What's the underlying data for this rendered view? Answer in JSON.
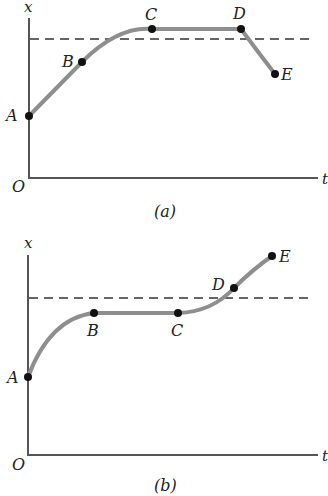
{
  "figures": [
    {
      "caption": "(a)",
      "y_axis_label": "x",
      "x_axis_label": "t",
      "origin_label": "O",
      "points": [
        {
          "label": "A"
        },
        {
          "label": "B"
        },
        {
          "label": "C"
        },
        {
          "label": "D"
        },
        {
          "label": "E"
        }
      ]
    },
    {
      "caption": "(b)",
      "y_axis_label": "x",
      "x_axis_label": "t",
      "origin_label": "O",
      "points": [
        {
          "label": "A"
        },
        {
          "label": "B"
        },
        {
          "label": "C"
        },
        {
          "label": "D"
        },
        {
          "label": "E"
        }
      ]
    }
  ],
  "colors": {
    "curve": "#8e8e8e",
    "axis": "#555555",
    "point": "#111111"
  }
}
